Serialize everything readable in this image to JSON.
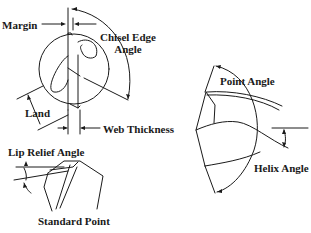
{
  "diagram": {
    "colors": {
      "ink": "#1a1a1a",
      "background": "#ffffff"
    },
    "end_view": {
      "labels": {
        "margin": "Margin",
        "chisel_edge_angle_line1": "Chisel Edge",
        "chisel_edge_angle_line2": "Angle",
        "land": "Land",
        "web_thickness": "Web Thickness"
      }
    },
    "side_view": {
      "labels": {
        "lip_relief_angle": "Lip Relief Angle",
        "standard_point": "Standard Point"
      }
    },
    "point_view": {
      "labels": {
        "point_angle": "Point Angle",
        "helix_angle": "Helix Angle"
      }
    }
  }
}
